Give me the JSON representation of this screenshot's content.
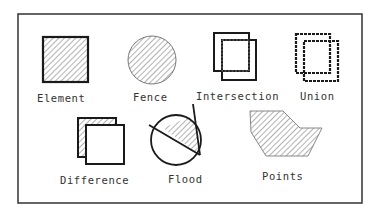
{
  "diagram": {
    "items": [
      {
        "id": "element",
        "label": "Element"
      },
      {
        "id": "fence",
        "label": "Fence"
      },
      {
        "id": "intersection",
        "label": "Intersection"
      },
      {
        "id": "union",
        "label": "Union"
      },
      {
        "id": "difference",
        "label": "Difference"
      },
      {
        "id": "flood",
        "label": "Flood"
      },
      {
        "id": "points",
        "label": "Points"
      }
    ],
    "colors": {
      "stroke": "#1a1a1a",
      "hatch": "#555555",
      "frame": "#333333"
    }
  }
}
